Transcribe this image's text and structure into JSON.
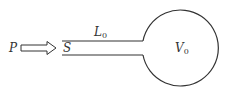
{
  "diagram": {
    "colors": {
      "stroke": "#333333",
      "background": "#ffffff"
    },
    "labels": {
      "pressure": {
        "main": "P",
        "sub": ""
      },
      "area": {
        "main": "S",
        "sub": ""
      },
      "length": {
        "main": "L",
        "sub": "0"
      },
      "volume": {
        "main": "V",
        "sub": "0"
      }
    },
    "pipe": {
      "x_start": 62,
      "x_end": 143,
      "y_top": 41,
      "y_bottom": 55
    },
    "bulb": {
      "cx": 181,
      "cy": 46,
      "r": 38
    },
    "arrow": {
      "x_start": 21,
      "x_end": 56,
      "y": 48,
      "direction": "right"
    }
  }
}
